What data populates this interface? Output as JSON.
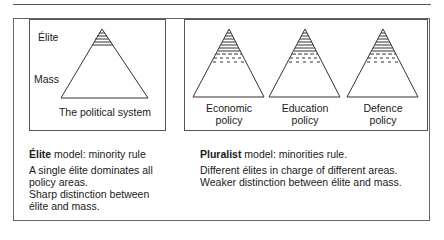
{
  "elite_panel": {
    "labels": {
      "top": "Élite",
      "bottom": "Mass"
    },
    "caption": "The political system"
  },
  "pluralist_panel": {
    "captions": [
      {
        "line1": "Economic",
        "line2": "policy"
      },
      {
        "line1": "Education",
        "line2": "policy"
      },
      {
        "line1": "Defence",
        "line2": "policy"
      }
    ]
  },
  "elite_description": {
    "title_bold": "Élite",
    "title_rest": " model: minority rule",
    "lines": [
      "A single élite dominates all",
      "policy areas.",
      "Sharp distinction between",
      "élite and mass."
    ]
  },
  "pluralist_description": {
    "title_bold": "Pluralist",
    "title_rest": " model: minorities rule.",
    "lines": [
      "Different élites in charge of different areas.",
      "Weaker distinction between élite and mass."
    ]
  },
  "colors": {
    "line": "#333333",
    "border": "#555555"
  }
}
